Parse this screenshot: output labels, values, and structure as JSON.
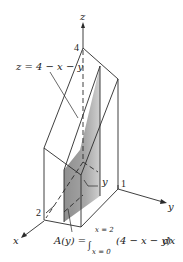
{
  "figure": {
    "axes": {
      "z_label": "z",
      "y_label": "y",
      "x_label": "x"
    },
    "ticks": {
      "z_tick": "4",
      "y_tick": "1",
      "x_tick": "2"
    },
    "surface_label": "z = 4 − x − y",
    "slice_label": "y",
    "formula": {
      "lhs": "A(y) =",
      "upper_limit": "x = 2",
      "lower_limit": "x = 0",
      "integrand": "(4 − x − y)",
      "differential": "dx"
    },
    "colors": {
      "line": "#2a2a2a",
      "shade_dark": "#8e8e8e",
      "shade_light": "#c4c4c4",
      "background": "#ffffff"
    }
  }
}
